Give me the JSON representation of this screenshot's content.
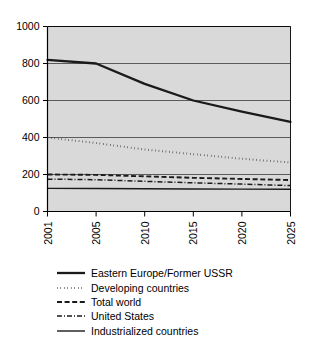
{
  "chart_data": {
    "type": "line",
    "title": "",
    "xlabel": "",
    "ylabel": "",
    "x": [
      2001,
      2005,
      2010,
      2015,
      2020,
      2025
    ],
    "xtick_labels": [
      "2001",
      "2005",
      "2010",
      "2015",
      "2020",
      "2025"
    ],
    "ytick_labels": [
      "0",
      "200",
      "400",
      "600",
      "800",
      "1000"
    ],
    "yticks": [
      0,
      200,
      400,
      600,
      800,
      1000
    ],
    "ylim": [
      0,
      1000
    ],
    "grid": true,
    "grid_axis": "y",
    "legend_position": "below",
    "plot_background": "#d9d9d9",
    "line_color": "#1a1a1a",
    "series": [
      {
        "name": "Eastern Europe/Former USSR",
        "style": "solid-thick",
        "values": [
          820,
          800,
          690,
          600,
          540,
          485
        ]
      },
      {
        "name": "Developing countries",
        "style": "dotted",
        "values": [
          400,
          370,
          335,
          310,
          285,
          265
        ]
      },
      {
        "name": "Total world",
        "style": "dashed",
        "values": [
          200,
          198,
          190,
          182,
          176,
          170
        ]
      },
      {
        "name": "United States",
        "style": "dash-dot",
        "values": [
          175,
          172,
          163,
          155,
          148,
          140
        ]
      },
      {
        "name": "Industrialized countries",
        "style": "solid-thin",
        "values": [
          125,
          124,
          123,
          122,
          121,
          120
        ]
      }
    ]
  }
}
